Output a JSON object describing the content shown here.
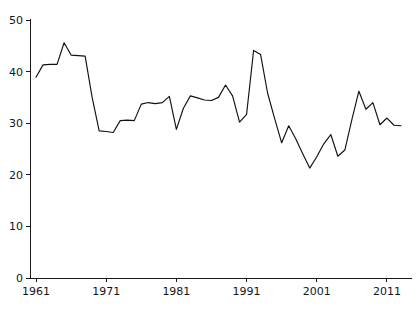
{
  "chart_data": {
    "type": "line",
    "title": "",
    "subtitle": "",
    "xlabel": "",
    "ylabel": "",
    "grid": false,
    "legend": false,
    "legend_position": "none",
    "line_color": "#111111",
    "axis_color": "#1a1a1a",
    "background": "#ffffff",
    "xlim": [
      1961,
      2013
    ],
    "ylim": [
      0,
      50
    ],
    "x_ticks": [
      1961,
      1971,
      1981,
      1991,
      2001,
      2011
    ],
    "x_tick_labels": [
      "1961",
      "1971",
      "1981",
      "1991",
      "2001",
      "2011"
    ],
    "y_ticks": [
      0,
      10,
      20,
      30,
      40,
      50
    ],
    "y_tick_labels": [
      "0",
      "10",
      "20",
      "30",
      "40",
      "50"
    ],
    "series": [
      {
        "name": "series-1",
        "color": "#111111",
        "x": [
          1961,
          1962,
          1963,
          1964,
          1965,
          1966,
          1967,
          1968,
          1969,
          1970,
          1971,
          1972,
          1973,
          1974,
          1975,
          1976,
          1977,
          1978,
          1979,
          1980,
          1981,
          1982,
          1983,
          1984,
          1985,
          1986,
          1987,
          1988,
          1989,
          1990,
          1991,
          1992,
          1993,
          1994,
          1995,
          1996,
          1997,
          1998,
          1999,
          2000,
          2001,
          2002,
          2003,
          2004,
          2005,
          2006,
          2007,
          2008,
          2009,
          2010,
          2011,
          2012,
          2013
        ],
        "values": [
          38.9,
          41.3,
          41.4,
          41.4,
          45.6,
          43.2,
          43.1,
          43.0,
          35.0,
          28.5,
          28.4,
          28.2,
          30.5,
          30.6,
          30.5,
          33.7,
          34.0,
          33.8,
          34.0,
          35.2,
          28.8,
          32.9,
          35.3,
          34.9,
          34.5,
          34.4,
          35.0,
          37.4,
          35.3,
          30.2,
          31.7,
          44.1,
          43.3,
          35.8,
          30.9,
          26.2,
          29.5,
          27.0,
          24.1,
          21.3,
          23.5,
          26.0,
          27.8,
          23.6,
          24.8,
          30.7,
          36.2,
          32.7,
          34.0,
          29.7,
          31.0,
          29.6,
          29.5
        ]
      }
    ]
  },
  "axes": {
    "x_axis_name": "year-axis",
    "y_axis_name": "value-axis"
  }
}
